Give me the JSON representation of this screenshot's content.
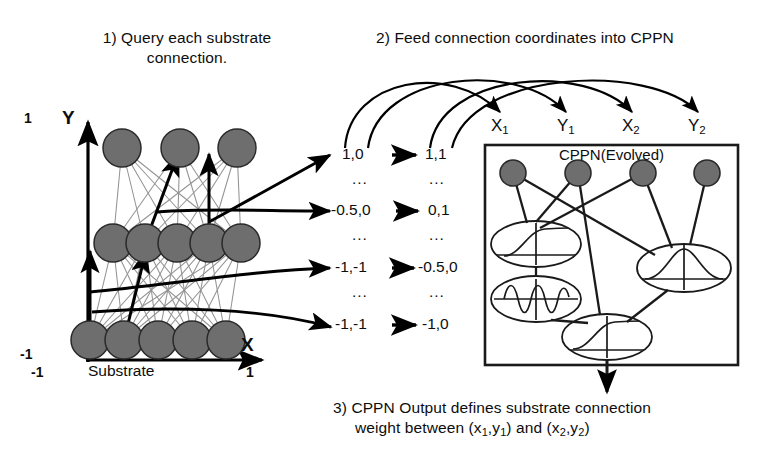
{
  "figure": {
    "captions": [
      {
        "id": "step1",
        "text": "1) Query each substrate connection."
      },
      {
        "id": "step2",
        "text": "2) Feed connection coordinates into CPPN"
      }
    ],
    "caption3_line1": "3) CPPN Output defines substrate connection",
    "caption3_line2_a": "weight between (x",
    "caption3_line2_b": ",y",
    "caption3_line2_c": ") and (x",
    "caption3_line2_d": ",y",
    "caption3_line2_e": ")",
    "sub1": "1",
    "sub2": "2",
    "and_word": " and "
  },
  "substrate": {
    "axis_y_label": "Y",
    "axis_x_label": "X",
    "y_max": "1",
    "y_min": "-1",
    "x_min": "-1",
    "x_max": "1",
    "plot_label": "Substrate",
    "node_color": "#6e6e6e",
    "node_stroke": "#2a2a2a",
    "thin_connection_color": "#8d8d8d",
    "query_arrow_color": "#000000",
    "layers": [
      {
        "name": "output-row",
        "count": 3
      },
      {
        "name": "hidden-row",
        "count": 5
      },
      {
        "name": "input-row",
        "count": 5
      }
    ]
  },
  "coordinates": {
    "arrow_glyph": "→",
    "ellipsis": "...",
    "pairs": [
      {
        "source": "1,0",
        "target": "1,1"
      },
      {
        "source": "-0.5,0",
        "target": "0,1"
      },
      {
        "source": "-1,-1",
        "target": "-0.5,0"
      },
      {
        "source": "-1,-1",
        "target": "-1,0"
      }
    ]
  },
  "cppn": {
    "title": "CPPN(Evolved)",
    "inputs": [
      {
        "label_base": "X",
        "label_sub": "1"
      },
      {
        "label_base": "Y",
        "label_sub": "1"
      },
      {
        "label_base": "X",
        "label_sub": "2"
      },
      {
        "label_base": "Y",
        "label_sub": "2"
      }
    ],
    "nodes": [
      {
        "id": "in1",
        "type": "input",
        "activation": "none"
      },
      {
        "id": "in2",
        "type": "input",
        "activation": "none"
      },
      {
        "id": "in3",
        "type": "input",
        "activation": "none"
      },
      {
        "id": "in4",
        "type": "input",
        "activation": "none"
      },
      {
        "id": "h1",
        "type": "hidden",
        "activation": "sigmoid"
      },
      {
        "id": "h2",
        "type": "hidden",
        "activation": "sine"
      },
      {
        "id": "h3",
        "type": "hidden",
        "activation": "gaussian"
      },
      {
        "id": "out",
        "type": "output",
        "activation": "sigmoid"
      }
    ],
    "box_stroke": "#1a1a1a",
    "node_color": "#6e6e6e"
  }
}
